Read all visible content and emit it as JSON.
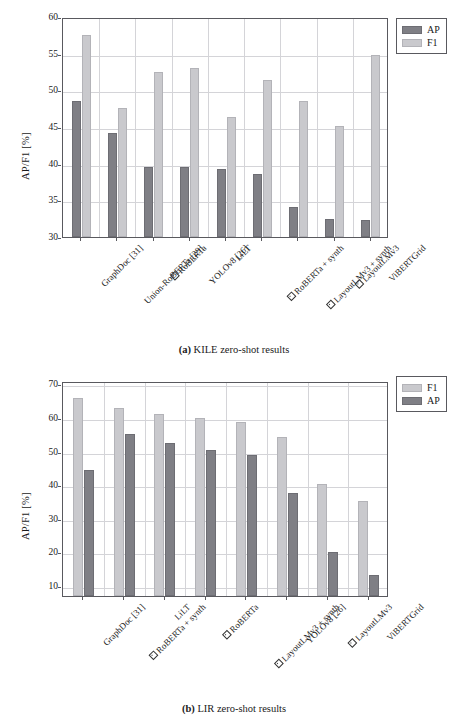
{
  "figures": [
    {
      "id": "a",
      "caption_tag": "(a)",
      "caption_text": "KILE zero-shot results",
      "legend": [
        {
          "key": "ap",
          "label": "AP",
          "color": "#7f7f85"
        },
        {
          "key": "f1",
          "label": "F1",
          "color": "#c9c9cd"
        }
      ],
      "chart_data": {
        "type": "bar",
        "title": "(a) KILE zero-shot results",
        "xlabel": "",
        "ylabel": "AP/F1 [%]",
        "ylim": [
          30,
          60
        ],
        "yticks": [
          30,
          35,
          40,
          45,
          50,
          55,
          60
        ],
        "grid": true,
        "legend_position": "outside-top-right",
        "categories": [
          "GraphDoc [31]",
          "Union-RoBERTa [29]",
          "□ RoBERTa",
          "YOLOv8 [26]",
          "LiLT",
          "□ RoBERTa + synth",
          "□ LayoutLMv3 + synth",
          "□ LayoutLMv3",
          "ViBERTGrid"
        ],
        "category_boxed": [
          false,
          false,
          true,
          false,
          false,
          true,
          true,
          true,
          false
        ],
        "category_plain": [
          "GraphDoc [31]",
          "Union-RoBERTa [29]",
          "RoBERTa",
          "YOLOv8 [26]",
          "LiLT",
          "RoBERTa + synth",
          "LayoutLMv3 + synth",
          "LayoutLMv3",
          "ViBERTGrid"
        ],
        "series": [
          {
            "name": "AP",
            "key": "ap",
            "values": [
              48.6,
              44.2,
              39.6,
              39.6,
              39.3,
              38.6,
              34.1,
              32.5,
              32.3
            ]
          },
          {
            "name": "F1",
            "key": "f1",
            "values": [
              57.6,
              47.6,
              52.5,
              53.0,
              46.4,
              51.4,
              48.6,
              45.1,
              54.8
            ]
          }
        ]
      }
    },
    {
      "id": "b",
      "caption_tag": "(b)",
      "caption_text": "LIR zero-shot results",
      "legend": [
        {
          "key": "f1",
          "label": "F1",
          "color": "#c9c9cd"
        },
        {
          "key": "ap",
          "label": "AP",
          "color": "#7f7f85"
        }
      ],
      "chart_data": {
        "type": "bar",
        "title": "(b) LIR zero-shot results",
        "xlabel": "",
        "ylabel": "AP/F1 [%]",
        "ylim": [
          7,
          71
        ],
        "yticks": [
          10,
          20,
          30,
          40,
          50,
          60,
          70
        ],
        "grid": true,
        "legend_position": "outside-top-right",
        "categories": [
          "GraphDoc [31]",
          "□ RoBERTa + synth",
          "LiLT",
          "□ RoBERTa",
          "□ LayoutLMv3 + synth",
          "YOLOv8 [26]",
          "□ LayoutLMv3",
          "ViBERTGrid"
        ],
        "category_boxed": [
          false,
          true,
          false,
          true,
          true,
          false,
          true,
          false
        ],
        "category_plain": [
          "GraphDoc [31]",
          "RoBERTa + synth",
          "LiLT",
          "RoBERTa",
          "LayoutLMv3 + synth",
          "YOLOv8 [26]",
          "LayoutLMv3",
          "ViBERTGrid"
        ],
        "series": [
          {
            "name": "F1",
            "key": "f1",
            "values": [
              65.9,
              63.1,
              61.3,
              60.0,
              58.8,
              54.4,
              40.4,
              35.3
            ]
          },
          {
            "name": "AP",
            "key": "ap",
            "values": [
              44.5,
              55.1,
              52.6,
              50.4,
              49.0,
              37.8,
              20.0,
              13.3
            ]
          }
        ]
      }
    }
  ]
}
